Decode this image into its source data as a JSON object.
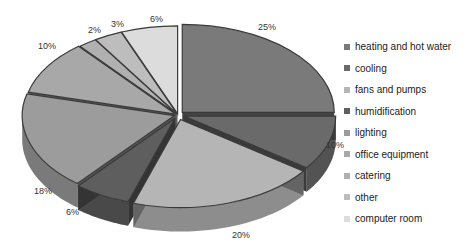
{
  "chart_data": {
    "type": "pie",
    "style": "3d-exploded",
    "title": "",
    "categories": [
      "heating and hot water",
      "cooling",
      "fans and pumps",
      "humidification",
      "lighting",
      "office equipment",
      "catering",
      "other",
      "computer room"
    ],
    "values": [
      25,
      10,
      20,
      6,
      18,
      10,
      2,
      3,
      6
    ],
    "labels": [
      "25%",
      "10%",
      "20%",
      "6%",
      "18%",
      "10%",
      "2%",
      "3%",
      "6%"
    ],
    "colors": [
      "#7a7a7a",
      "#6a6a6a",
      "#b5b5b5",
      "#5e5e5e",
      "#9c9c9c",
      "#a8a8a8",
      "#b0b0b0",
      "#bdbdbd",
      "#dcdcdc"
    ],
    "legend_position": "right"
  },
  "legend": {
    "items": [
      {
        "label": "heating and hot water",
        "color": "#7a7a7a"
      },
      {
        "label": "cooling",
        "color": "#6a6a6a"
      },
      {
        "label": "fans and pumps",
        "color": "#b5b5b5"
      },
      {
        "label": "humidification",
        "color": "#5e5e5e"
      },
      {
        "label": "lighting",
        "color": "#9c9c9c"
      },
      {
        "label": "office equipment",
        "color": "#a8a8a8"
      },
      {
        "label": "catering",
        "color": "#b0b0b0"
      },
      {
        "label": "other",
        "color": "#bdbdbd"
      },
      {
        "label": "computer room",
        "color": "#dcdcdc"
      }
    ]
  }
}
